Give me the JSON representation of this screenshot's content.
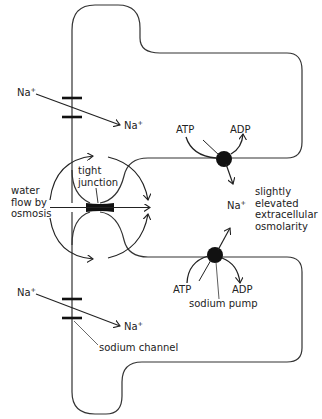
{
  "diagram": {
    "type": "biology-schematic",
    "labels": {
      "na_upper_outside": "Na",
      "na_upper_inside": "Na",
      "na_lower_outside": "Na",
      "na_lower_inside": "Na",
      "na_extracellular": "Na",
      "plus": "+",
      "atp_upper": "ATP",
      "adp_upper": "ADP",
      "atp_lower": "ATP",
      "adp_lower": "ADP",
      "tight_junction": "tight junction",
      "water_flow": "water flow by osmosis",
      "osmolarity": "slightly elevated extracellular osmolarity",
      "sodium_pump": "sodium pump",
      "sodium_channel": "sodium channel"
    },
    "components": [
      {
        "id": "upper-cell",
        "kind": "cell"
      },
      {
        "id": "lower-cell",
        "kind": "cell"
      },
      {
        "id": "upper-sodium-channel",
        "kind": "sodium channel"
      },
      {
        "id": "lower-sodium-channel",
        "kind": "sodium channel"
      },
      {
        "id": "upper-sodium-pump",
        "kind": "sodium pump",
        "consumes": "ATP",
        "produces": "ADP"
      },
      {
        "id": "lower-sodium-pump",
        "kind": "sodium pump",
        "consumes": "ATP",
        "produces": "ADP"
      },
      {
        "id": "tight-junction",
        "kind": "tight junction"
      }
    ],
    "colors": {
      "line": "#222222",
      "fill": "#111111",
      "background": "#ffffff"
    }
  }
}
